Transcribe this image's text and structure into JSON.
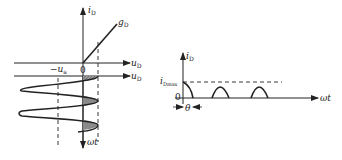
{
  "left_diagram": {
    "vertical_axis_label": {
      "main": "i",
      "sub": "D"
    },
    "conductance_line_label": {
      "main": "g",
      "sub": "D"
    },
    "upper_horizontal_axis_label": {
      "main": "u",
      "sub": "D"
    },
    "lower_horizontal_axis_label": {
      "main": "u",
      "sub": "D"
    },
    "origin_label": "0",
    "bias_label": {
      "prefix": "−",
      "main": "u",
      "sub": "a"
    },
    "time_axis_label": "ωt"
  },
  "right_diagram": {
    "vertical_axis_label": {
      "main": "i",
      "sub": "D"
    },
    "peak_label": {
      "main": "i",
      "sub": "Dmax"
    },
    "origin_label": "0",
    "time_axis_label": "ωt",
    "angle_label": "θ"
  },
  "colors": {
    "stroke": "#222222",
    "shade": "#8a8a8a",
    "background": "#ffffff"
  }
}
